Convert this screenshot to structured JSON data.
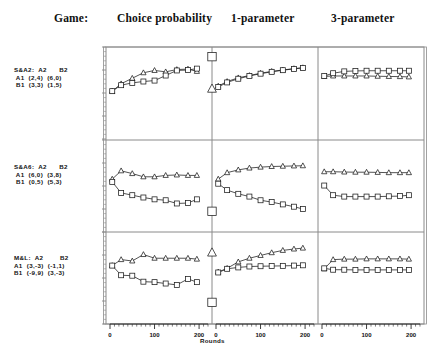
{
  "header": {
    "game_label": "Game:",
    "columns": [
      "Choice probability",
      "1-parameter",
      "3-parameter"
    ]
  },
  "axis": {
    "xlabel": "Rounds",
    "xticks": [
      0,
      100,
      200
    ],
    "xlim": [
      0,
      220
    ],
    "ylim": [
      0,
      1
    ],
    "yticks_labeled": false,
    "grid": false
  },
  "games": [
    {
      "name": "S&A2",
      "col_headers": [
        "A2",
        "B2"
      ],
      "rows": [
        {
          "label": "A1",
          "cells": [
            "(2,4)",
            "(6,0)"
          ]
        },
        {
          "label": "B1",
          "cells": [
            "(3,3)",
            "(1,5)"
          ]
        }
      ],
      "text": "S&A2:  A2      B2\n A1  (2,4)  (6,0)\n B1  (3,3)  (1,5)"
    },
    {
      "name": "S&A6",
      "col_headers": [
        "A2",
        "B2"
      ],
      "rows": [
        {
          "label": "A1",
          "cells": [
            "(6,0)",
            "(3,8)"
          ]
        },
        {
          "label": "B1",
          "cells": [
            "(0,5)",
            "(5,3)"
          ]
        }
      ],
      "text": "S&A6:  A2      B2\n A1  (6,0)  (3,8)\n B1  (0,5)  (5,3)"
    },
    {
      "name": "M&L",
      "col_headers": [
        "A2",
        "B2"
      ],
      "rows": [
        {
          "label": "A1",
          "cells": [
            "(3,-3)",
            "(-1,1)"
          ]
        },
        {
          "label": "B1",
          "cells": [
            "(-9,9)",
            "(3,-3)"
          ]
        }
      ],
      "text": "M&L:  A2        B2\nA1  (3,-3)  (-1,1)\nB1  (-9,9)  (3,-3)"
    }
  ],
  "chart_data": {
    "type": "line",
    "title": "",
    "xlabel": "Rounds",
    "ylabel": "",
    "xlim": [
      0,
      220
    ],
    "ylim": [
      0,
      1
    ],
    "grid": false,
    "legend": "none",
    "marker_series": [
      "triangle",
      "square"
    ],
    "panels": [
      {
        "row": 0,
        "column": 0,
        "game": "S&A2",
        "column_label": "Choice probability",
        "series": [
          {
            "name": "triangle",
            "marker": "triangle",
            "x": [
              5,
              25,
              50,
              75,
              100,
              125,
              150,
              175,
              195
            ],
            "y": [
              0.52,
              0.6,
              0.66,
              0.72,
              0.745,
              0.73,
              0.755,
              0.76,
              0.735
            ]
          },
          {
            "name": "square",
            "marker": "square",
            "x": [
              5,
              25,
              50,
              75,
              100,
              125,
              150,
              175,
              195
            ],
            "y": [
              0.52,
              0.585,
              0.61,
              0.625,
              0.635,
              0.69,
              0.745,
              0.75,
              0.765
            ]
          }
        ]
      },
      {
        "row": 0,
        "column": 1,
        "game": "S&A2",
        "column_label": "1-parameter",
        "series": [
          {
            "name": "triangle",
            "marker": "triangle",
            "x": [
              5,
              25,
              50,
              75,
              100,
              125,
              150,
              175,
              195
            ],
            "y": [
              0.575,
              0.625,
              0.665,
              0.69,
              0.715,
              0.735,
              0.75,
              0.765,
              0.775
            ]
          },
          {
            "name": "square",
            "marker": "square",
            "x": [
              5,
              25,
              50,
              75,
              100,
              125,
              150,
              175,
              195
            ],
            "y": [
              0.565,
              0.615,
              0.655,
              0.685,
              0.71,
              0.73,
              0.748,
              0.762,
              0.772
            ]
          }
        ]
      },
      {
        "row": 0,
        "column": 2,
        "game": "S&A2",
        "column_label": "3-parameter",
        "series": [
          {
            "name": "triangle",
            "marker": "triangle",
            "x": [
              5,
              25,
              50,
              75,
              100,
              125,
              150,
              175,
              195
            ],
            "y": [
              0.68,
              0.685,
              0.685,
              0.685,
              0.685,
              0.682,
              0.68,
              0.678,
              0.675
            ]
          },
          {
            "name": "square",
            "marker": "square",
            "x": [
              5,
              25,
              50,
              75,
              100,
              125,
              150,
              175,
              195
            ],
            "y": [
              0.685,
              0.715,
              0.735,
              0.74,
              0.742,
              0.742,
              0.742,
              0.742,
              0.742
            ]
          }
        ]
      },
      {
        "row": 1,
        "column": 0,
        "game": "S&A6",
        "column_label": "Choice probability",
        "series": [
          {
            "name": "triangle",
            "marker": "triangle",
            "x": [
              5,
              25,
              50,
              75,
              100,
              125,
              150,
              175,
              195
            ],
            "y": [
              0.575,
              0.665,
              0.635,
              0.6,
              0.6,
              0.615,
              0.62,
              0.615,
              0.615
            ]
          },
          {
            "name": "square",
            "marker": "square",
            "x": [
              5,
              25,
              50,
              75,
              100,
              125,
              150,
              175,
              195
            ],
            "y": [
              0.545,
              0.425,
              0.4,
              0.375,
              0.355,
              0.345,
              0.31,
              0.315,
              0.355
            ]
          }
        ]
      },
      {
        "row": 1,
        "column": 1,
        "game": "S&A6",
        "column_label": "1-parameter",
        "series": [
          {
            "name": "triangle",
            "marker": "triangle",
            "x": [
              5,
              25,
              50,
              75,
              100,
              125,
              150,
              175,
              195
            ],
            "y": [
              0.575,
              0.645,
              0.675,
              0.695,
              0.705,
              0.712,
              0.715,
              0.718,
              0.72
            ]
          },
          {
            "name": "square",
            "marker": "square",
            "x": [
              5,
              25,
              50,
              75,
              100,
              125,
              150,
              175,
              195
            ],
            "y": [
              0.525,
              0.455,
              0.415,
              0.385,
              0.345,
              0.325,
              0.3,
              0.275,
              0.25
            ]
          }
        ]
      },
      {
        "row": 1,
        "column": 2,
        "game": "S&A6",
        "column_label": "3-parameter",
        "series": [
          {
            "name": "triangle",
            "marker": "triangle",
            "x": [
              5,
              25,
              50,
              75,
              100,
              125,
              150,
              175,
              195
            ],
            "y": [
              0.655,
              0.655,
              0.652,
              0.65,
              0.65,
              0.648,
              0.645,
              0.645,
              0.645
            ]
          },
          {
            "name": "square",
            "marker": "square",
            "x": [
              5,
              25,
              50,
              75,
              100,
              125,
              150,
              175,
              195
            ],
            "y": [
              0.505,
              0.4,
              0.385,
              0.385,
              0.385,
              0.385,
              0.388,
              0.39,
              0.4
            ]
          }
        ]
      },
      {
        "row": 2,
        "column": 0,
        "game": "M&L",
        "column_label": "Choice probability",
        "series": [
          {
            "name": "triangle",
            "marker": "triangle",
            "x": [
              5,
              25,
              50,
              75,
              100,
              125,
              150,
              175,
              195
            ],
            "y": [
              0.635,
              0.7,
              0.685,
              0.755,
              0.715,
              0.715,
              0.715,
              0.715,
              0.705
            ]
          },
          {
            "name": "square",
            "marker": "square",
            "x": [
              5,
              25,
              50,
              75,
              100,
              125,
              150,
              175,
              195
            ],
            "y": [
              0.635,
              0.53,
              0.525,
              0.46,
              0.455,
              0.44,
              0.425,
              0.49,
              0.455
            ]
          }
        ]
      },
      {
        "row": 2,
        "column": 1,
        "game": "M&L",
        "column_label": "1-parameter",
        "series": [
          {
            "name": "triangle",
            "marker": "triangle",
            "x": [
              5,
              25,
              50,
              75,
              100,
              125,
              150,
              175,
              195
            ],
            "y": [
              0.565,
              0.605,
              0.675,
              0.715,
              0.745,
              0.775,
              0.8,
              0.815,
              0.825
            ]
          },
          {
            "name": "square",
            "marker": "square",
            "x": [
              5,
              25,
              50,
              75,
              100,
              125,
              150,
              175,
              195
            ],
            "y": [
              0.56,
              0.6,
              0.615,
              0.625,
              0.628,
              0.63,
              0.632,
              0.635,
              0.638
            ]
          }
        ]
      },
      {
        "row": 2,
        "column": 2,
        "game": "M&L",
        "column_label": "3-parameter",
        "series": [
          {
            "name": "triangle",
            "marker": "triangle",
            "x": [
              5,
              25,
              50,
              75,
              100,
              125,
              150,
              175,
              195
            ],
            "y": [
              0.6,
              0.7,
              0.705,
              0.705,
              0.708,
              0.708,
              0.708,
              0.708,
              0.705
            ]
          },
          {
            "name": "square",
            "marker": "square",
            "x": [
              5,
              25,
              50,
              75,
              100,
              125,
              150,
              175,
              195
            ],
            "y": [
              0.605,
              0.59,
              0.59,
              0.588,
              0.588,
              0.588,
              0.588,
              0.588,
              0.588
            ]
          }
        ]
      }
    ],
    "edge_markers": [
      {
        "row": 0,
        "marker": "square",
        "y": 0.895
      },
      {
        "row": 0,
        "marker": "triangle",
        "y": 0.545
      },
      {
        "row": 1,
        "marker": "square",
        "y": 0.225
      },
      {
        "row": 2,
        "marker": "triangle",
        "y": 0.775
      },
      {
        "row": 2,
        "marker": "square",
        "y": 0.235
      }
    ]
  },
  "colors": {
    "line": "#1a1a1a",
    "frame": "#8a8a8a",
    "text": "#111111",
    "background": "#ffffff"
  }
}
